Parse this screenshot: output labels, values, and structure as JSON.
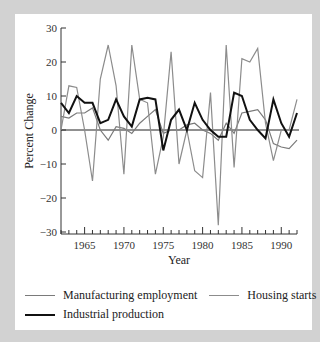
{
  "chart_data": {
    "type": "line",
    "title": "",
    "xlabel": "Year",
    "ylabel": "Percent Change",
    "xlim": [
      1962,
      1992
    ],
    "ylim": [
      -30,
      30
    ],
    "x_ticks": [
      1965,
      1970,
      1975,
      1980,
      1985,
      1990
    ],
    "y_ticks": [
      30,
      20,
      10,
      0,
      -10,
      -20,
      -30
    ],
    "y_tick_labels": [
      "30",
      "20",
      "10",
      "0",
      "−10",
      "−20",
      "−30"
    ],
    "grid": false,
    "zero_line": true,
    "legend_position": "bottom",
    "x": [
      1962,
      1963,
      1964,
      1965,
      1966,
      1967,
      1968,
      1969,
      1970,
      1971,
      1972,
      1973,
      1974,
      1975,
      1976,
      1977,
      1978,
      1979,
      1980,
      1981,
      1982,
      1983,
      1984,
      1985,
      1986,
      1987,
      1988,
      1989,
      1990,
      1991,
      1992
    ],
    "series": [
      {
        "name": "Manufacturing employment",
        "color": "#7a7a7a",
        "width": 1.2,
        "values": [
          4,
          3.5,
          5,
          5,
          6.5,
          0,
          -3,
          1,
          0.5,
          -1,
          2,
          4,
          6,
          -1,
          0,
          0,
          1.5,
          2,
          0,
          -1,
          -3,
          2,
          -1,
          5,
          5.5,
          6,
          3,
          -4,
          -5,
          -5.5,
          -3
        ]
      },
      {
        "name": "Housing starts",
        "color": "#8c8c8c",
        "width": 1.2,
        "values": [
          0,
          13,
          12.5,
          0,
          -15,
          15,
          25,
          13,
          -13,
          25,
          9,
          8,
          -13,
          -2,
          23,
          -10,
          0,
          -12,
          -14,
          11,
          -28,
          25,
          -11,
          21,
          20,
          24,
          2,
          -9,
          0,
          0,
          9
        ]
      },
      {
        "name": "Industrial production",
        "color": "#111111",
        "width": 2,
        "values": [
          8,
          5,
          10,
          8,
          8,
          2,
          3,
          9,
          4,
          1,
          9,
          9.5,
          9,
          -6,
          3,
          6,
          0,
          8,
          3,
          0,
          -2,
          -2,
          11,
          10,
          3,
          0,
          -2.5,
          9,
          2,
          -2,
          5
        ]
      }
    ]
  },
  "legend": {
    "items": [
      {
        "label": "Manufacturing employment"
      },
      {
        "label": "Housing starts"
      },
      {
        "label": "Industrial production"
      }
    ]
  }
}
